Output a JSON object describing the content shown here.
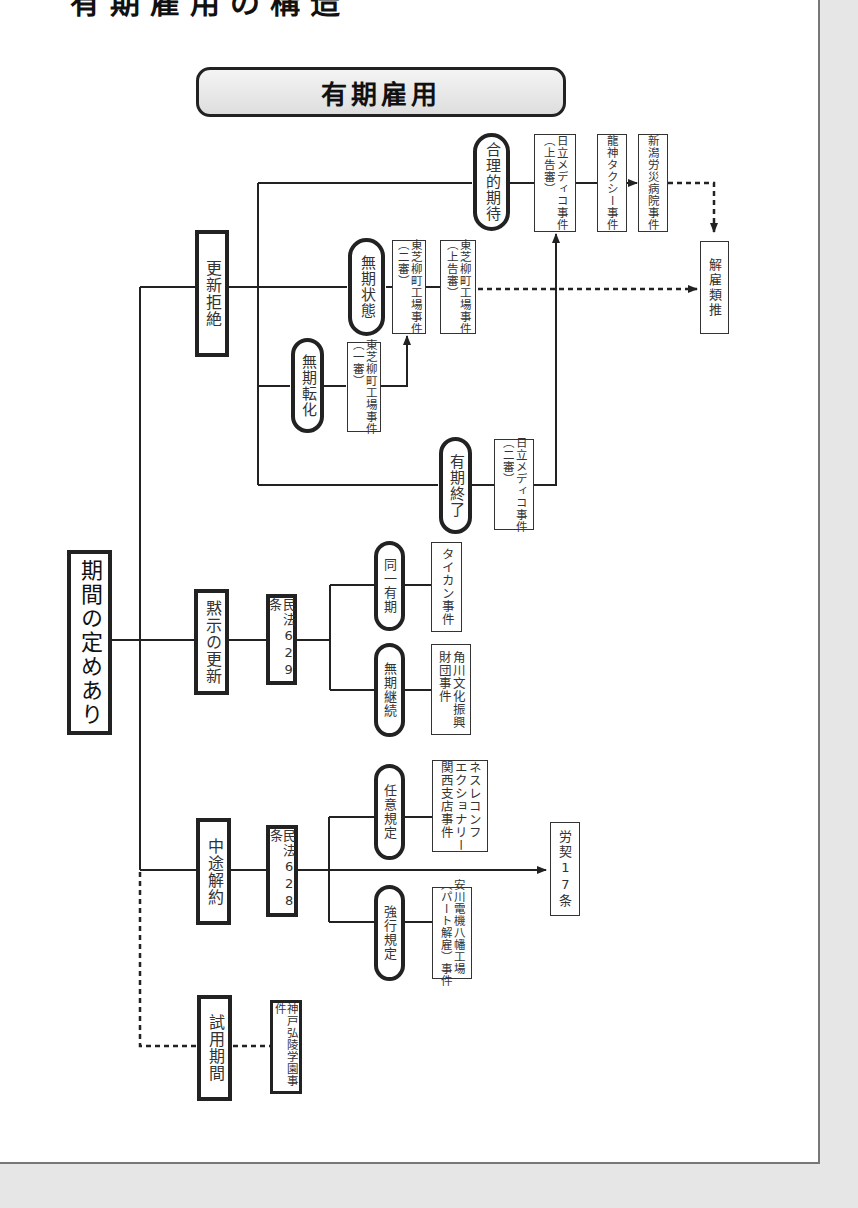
{
  "heading_clipped": "有期雇用の構造",
  "title": "有期雇用",
  "root": "期間の定めあり",
  "categories": {
    "renewal_refusal": "更新拒絶",
    "implied_renewal": "黙示の更新",
    "mid_term": "中途解約",
    "trial": "試用期間"
  },
  "conditions": {
    "reasonable_expectation": "合理的期待",
    "indefinite_state": "無期状態",
    "indefinite_conversion": "無期転化",
    "term_end": "有期終了",
    "same_term": "同一有期",
    "indefinite_continue": "無期継続",
    "optional_rule": "任意規定",
    "mandatory_rule": "強行規定"
  },
  "laws": {
    "civil629": "民法629条",
    "civil628": "民法628条",
    "labor17": "労契17条",
    "dismissal_analogy": "解雇類推"
  },
  "cases": {
    "hitachi_appeal": [
      "日立メディコ事件",
      "（上告審）"
    ],
    "ryujin": "龍神タクシー事件",
    "niigata": "新潟労災病院事件",
    "toshiba_2nd": [
      "東芝柳町工場事件",
      "（二審）"
    ],
    "toshiba_appeal": [
      "東芝柳町工場事件",
      "（上告審）"
    ],
    "toshiba_1st": [
      "東芝柳町工場事件",
      "（一審）"
    ],
    "hitachi_2nd": [
      "日立メディコ事件",
      "（二審）"
    ],
    "taikan": "タイカン事件",
    "kadokawa": [
      "角川文化振興",
      "財団事件"
    ],
    "nestle": [
      "ネスレコンフ",
      "エクショナリー",
      "関西支店事件"
    ],
    "yasukawa": [
      "安川電機八幡工場",
      "（パート解雇）事件"
    ],
    "kobe": "神戸弘陵学園事件"
  }
}
